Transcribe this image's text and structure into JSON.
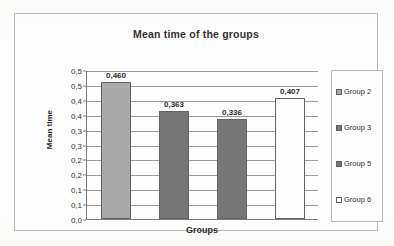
{
  "chart_data": {
    "type": "bar",
    "title": "Mean time of the groups",
    "xlabel": "Groups",
    "ylabel": "Mean time",
    "categories": [
      "Group 2",
      "Group 3",
      "Group 5",
      "Group 6"
    ],
    "values": [
      0.46,
      0.363,
      0.336,
      0.407
    ],
    "value_labels": [
      "0,460",
      "0,363",
      "0,336",
      "0,407"
    ],
    "ylim": [
      0.0,
      0.5
    ],
    "ytick_values": [
      0.5,
      0.45,
      0.4,
      0.35,
      0.3,
      0.25,
      0.2,
      0.15,
      0.1,
      0.05,
      0.0
    ],
    "ytick_labels": [
      "0,5",
      "0,5",
      "0,4",
      "0,4",
      "0,3",
      "0,3",
      "0,2",
      "0,2",
      "0,1",
      "0,1",
      "0,0"
    ],
    "grid": true,
    "legend_position": "right",
    "decimal_separator": ",",
    "bar_colors": [
      "#a9a9a9",
      "#757575",
      "#767676",
      "#fdfdfd"
    ],
    "bar_border_color": "#636363",
    "series": [
      {
        "name": "Mean time",
        "points": [
          {
            "category": "Group 2",
            "value": 0.46,
            "label": "0,460",
            "color": "#a9a9a9"
          },
          {
            "category": "Group 3",
            "value": 0.363,
            "label": "0,363",
            "color": "#757575"
          },
          {
            "category": "Group 5",
            "value": 0.336,
            "label": "0,336",
            "color": "#767676"
          },
          {
            "category": "Group 6",
            "value": 0.407,
            "label": "0,407",
            "color": "#fdfdfd"
          }
        ]
      }
    ]
  },
  "legend": {
    "items": [
      {
        "label": "Group 2",
        "color": "#a9a9a9"
      },
      {
        "label": "Group 3",
        "color": "#757575"
      },
      {
        "label": "Group 5",
        "color": "#767676"
      },
      {
        "label": "Group 6",
        "color": "#fdfdfd"
      }
    ]
  }
}
